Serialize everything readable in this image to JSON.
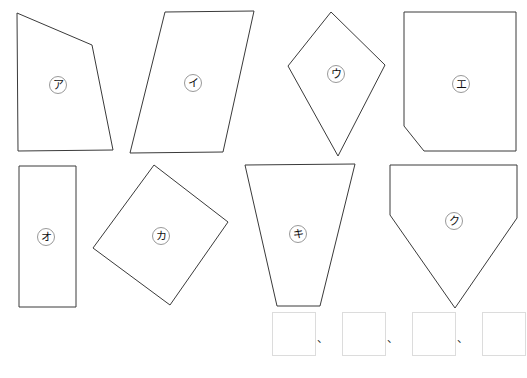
{
  "worksheet": {
    "background_color": "#ffffff",
    "outline_color": "#3a3a3a",
    "label_circle_color": "#8d8d8d",
    "answer_box_border_color": "#dcdcdc"
  },
  "shapes": [
    {
      "id": "shape-a",
      "label": "ア",
      "kind": "quadrilateral",
      "points": "17,13 92,45 113,150 18,151",
      "label_x": 58,
      "label_y": 85
    },
    {
      "id": "shape-i",
      "label": "イ",
      "kind": "parallelogram",
      "points": "165,12 254,11 223,152 130,153",
      "label_x": 193,
      "label_y": 83
    },
    {
      "id": "shape-u",
      "label": "ウ",
      "kind": "kite",
      "points": "331,12 385,65 338,156 288,66",
      "label_x": 336,
      "label_y": 74
    },
    {
      "id": "shape-e",
      "label": "エ",
      "kind": "rectangle-with-cut-corner",
      "points": "404,12 516,12 516,151 424,151 404,126",
      "label_x": 461,
      "label_y": 84
    },
    {
      "id": "shape-o",
      "label": "オ",
      "kind": "rectangle",
      "points": "19,166 76,166 76,307 19,307",
      "label_x": 46,
      "label_y": 237
    },
    {
      "id": "shape-ka",
      "label": "カ",
      "kind": "rotated-square",
      "points": "154,165 228,222 170,305 93,248",
      "label_x": 161,
      "label_y": 236
    },
    {
      "id": "shape-ki",
      "label": "キ",
      "kind": "trapezoid",
      "points": "245,165 355,164 320,306 277,306",
      "label_x": 298,
      "label_y": 234
    },
    {
      "id": "shape-ku",
      "label": "ク",
      "kind": "pentagon",
      "points": "390,165 517,165 517,218 455,308 390,215",
      "label_x": 454,
      "label_y": 221
    }
  ],
  "answer_row": {
    "slots": [
      {
        "value": "",
        "separator": "、",
        "left": 0
      },
      {
        "value": "",
        "separator": "、",
        "left": 70
      },
      {
        "value": "",
        "separator": "、",
        "left": 140
      },
      {
        "value": "",
        "separator": "",
        "left": 210
      }
    ]
  }
}
